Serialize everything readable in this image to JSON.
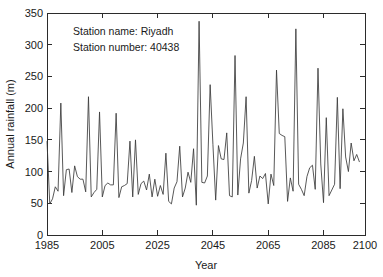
{
  "chart_data": {
    "type": "line",
    "title": "",
    "xlabel": "Year",
    "ylabel": "Annual rainfall (m)",
    "xlim": [
      1985,
      2100
    ],
    "ylim": [
      0,
      350
    ],
    "xticks": [
      1985,
      2005,
      2025,
      2045,
      2065,
      2085,
      2100
    ],
    "xticklabels": [
      "1985",
      "2005",
      "2025",
      "2045",
      "2065",
      "2085",
      "2100"
    ],
    "yticks": [
      0,
      50,
      100,
      150,
      200,
      250,
      300,
      350
    ],
    "yticklabels": [
      "0",
      "50",
      "100",
      "150",
      "200",
      "250",
      "300",
      "350"
    ],
    "grid": false,
    "legend": null,
    "line_color": "#3a3a3a",
    "background": "#ffffff",
    "annotations": [
      "Station name: Riyadh",
      "Station number: 40438"
    ],
    "series": [
      {
        "name": "Annual rainfall",
        "x": [
          1985,
          1986,
          1987,
          1988,
          1989,
          1990,
          1991,
          1992,
          1993,
          1994,
          1995,
          1996,
          1997,
          1998,
          1999,
          2000,
          2001,
          2002,
          2003,
          2004,
          2005,
          2006,
          2007,
          2008,
          2009,
          2010,
          2011,
          2012,
          2013,
          2014,
          2015,
          2016,
          2017,
          2018,
          2019,
          2020,
          2021,
          2022,
          2023,
          2024,
          2025,
          2026,
          2027,
          2028,
          2029,
          2030,
          2031,
          2032,
          2033,
          2034,
          2035,
          2036,
          2037,
          2038,
          2039,
          2040,
          2041,
          2042,
          2043,
          2044,
          2045,
          2046,
          2047,
          2048,
          2049,
          2050,
          2051,
          2052,
          2053,
          2054,
          2055,
          2056,
          2057,
          2058,
          2059,
          2060,
          2061,
          2062,
          2063,
          2064,
          2065,
          2066,
          2067,
          2068,
          2069,
          2070,
          2071,
          2072,
          2073,
          2074,
          2075,
          2076,
          2077,
          2078,
          2079,
          2080,
          2081,
          2082,
          2083,
          2084,
          2085,
          2086,
          2087,
          2088,
          2089,
          2090,
          2091,
          2092,
          2093,
          2094,
          2095,
          2096,
          2097,
          2098
        ],
        "values": [
          148,
          49,
          57,
          76,
          69,
          208,
          62,
          103,
          104,
          67,
          109,
          92,
          88,
          88,
          68,
          218,
          60,
          67,
          72,
          194,
          60,
          78,
          82,
          79,
          79,
          192,
          59,
          76,
          78,
          81,
          148,
          60,
          150,
          64,
          81,
          85,
          71,
          96,
          60,
          88,
          61,
          78,
          64,
          129,
          53,
          49,
          74,
          84,
          140,
          60,
          74,
          99,
          83,
          136,
          47,
          337,
          83,
          82,
          93,
          237,
          143,
          55,
          141,
          120,
          119,
          161,
          62,
          60,
          283,
          63,
          120,
          145,
          218,
          66,
          86,
          124,
          74,
          93,
          89,
          97,
          49,
          96,
          78,
          260,
          160,
          157,
          155,
          53,
          90,
          69,
          325,
          80,
          72,
          62,
          92,
          106,
          110,
          72,
          263,
          112,
          51,
          185,
          62,
          71,
          80,
          217,
          73,
          199,
          123,
          100,
          145,
          117,
          127,
          115
        ]
      }
    ]
  },
  "axes": {
    "y_axis_title": "Annual rainfall (m)",
    "x_axis_title": "Year"
  },
  "annotation_block": {
    "line1": "Station name: Riyadh",
    "line2": "Station number: 40438"
  }
}
